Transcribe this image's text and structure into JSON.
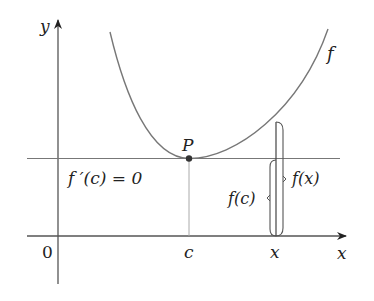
{
  "diagram": {
    "axes": {
      "x_label": "x",
      "y_label": "y",
      "origin_label": "0"
    },
    "curve": {
      "label": "f"
    },
    "point": {
      "label": "P"
    },
    "tangent_annotation": "f ′(c) = 0",
    "x_ticks": [
      {
        "label": "c"
      },
      {
        "label": "x"
      }
    ],
    "braces": [
      {
        "label": "f(c)"
      },
      {
        "label": "f(x)"
      }
    ],
    "colors": {
      "curve": "#777777",
      "axes": "#555555",
      "text": "#222222",
      "point": "#333333"
    }
  }
}
